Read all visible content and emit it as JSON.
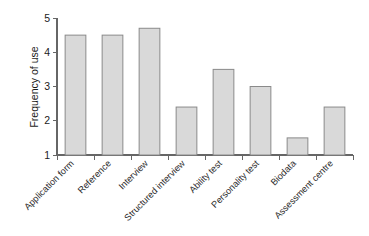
{
  "chart_data": {
    "type": "bar",
    "title": "",
    "xlabel": "",
    "ylabel": "Frequency of use",
    "categories": [
      "Application form",
      "Reference",
      "Interview",
      "Structured interview",
      "Ability test",
      "Personality test",
      "Biodata",
      "Assessment centre"
    ],
    "values": [
      4.5,
      4.5,
      4.7,
      2.4,
      3.5,
      3.0,
      1.5,
      2.4
    ],
    "ylim": [
      1,
      5
    ],
    "yticks": [
      1,
      2,
      3,
      4,
      5
    ],
    "ytick_labels": [
      "1",
      "2",
      "3",
      "4",
      "5"
    ],
    "grid": false,
    "legend": null,
    "legend_position": "none",
    "bar_fill_color": "#d9d9d9",
    "bar_border_color": "#8a8a8a",
    "axis_color": "#666666",
    "background_color": "#ffffff",
    "xtick_label_rotation": -45
  }
}
